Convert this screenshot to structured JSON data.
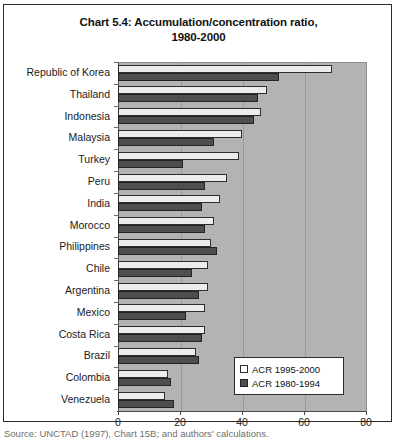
{
  "figure": {
    "title_line1": "Chart 5.4:  Accumulation/concentration ratio,",
    "title_line2": "1980-2000",
    "source_note": "Source:  UNCTAD (1997), Chart 15B; and authors' calculations."
  },
  "legend": {
    "position": "inside-bottom-right",
    "entries": [
      {
        "label": "ACR 1995-2000",
        "swatch": "light-swatch",
        "color": "#ffffff"
      },
      {
        "label": "ACR 1980-1994",
        "swatch": "dark-swatch",
        "color": "#4e4e4e"
      }
    ]
  },
  "axis": {
    "x_ticks": [
      "0",
      "20",
      "40",
      "60",
      "80"
    ]
  },
  "chart_data": {
    "type": "bar",
    "orientation": "horizontal",
    "title": "Chart 5.4:  Accumulation/concentration ratio, 1980-2000",
    "xlabel": "",
    "ylabel": "",
    "xlim": [
      0,
      80
    ],
    "grid": true,
    "legend_position": "inside-bottom-right",
    "categories": [
      "Republic of Korea",
      "Thailand",
      "Indonesia",
      "Malaysia",
      "Turkey",
      "Peru",
      "India",
      "Morocco",
      "Philippines",
      "Chile",
      "Argentina",
      "Mexico",
      "Costa Rica",
      "Brazil",
      "Colombia",
      "Venezuela"
    ],
    "series": [
      {
        "name": "ACR 1995-2000",
        "color": "#ececec",
        "values": [
          69,
          48,
          46,
          40,
          39,
          35,
          33,
          31,
          30,
          29,
          29,
          28,
          28,
          25,
          16,
          15
        ]
      },
      {
        "name": "ACR 1980-1994",
        "color": "#4e4e4e",
        "values": [
          52,
          45,
          44,
          31,
          21,
          28,
          27,
          28,
          32,
          24,
          26,
          22,
          27,
          26,
          17,
          18
        ]
      }
    ]
  }
}
